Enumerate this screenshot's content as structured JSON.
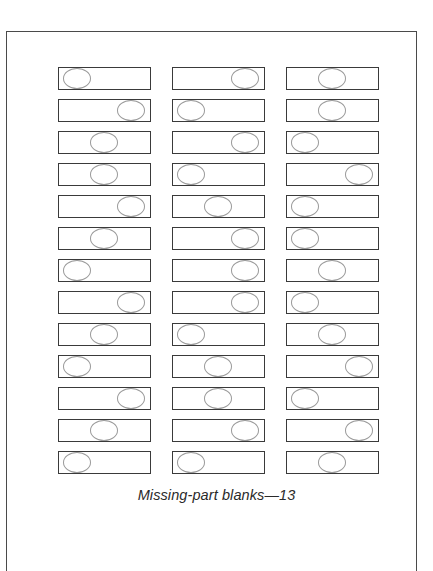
{
  "caption": "Missing-part blanks—13",
  "layout": {
    "column_x": [
      58,
      172,
      286
    ],
    "row_start_y": 67,
    "row_pitch": 32,
    "rows": 13
  },
  "colors": {
    "frame": "#4a4a4a",
    "blank_border": "#3a3a3a",
    "oval_border": "#9a9a9a",
    "caption": "#2a2a2a"
  },
  "columns": [
    {
      "name": "column-1",
      "oval_positions": [
        "L",
        "R",
        "C",
        "C",
        "R",
        "C",
        "L",
        "R",
        "C",
        "L",
        "R",
        "C",
        "L"
      ]
    },
    {
      "name": "column-2",
      "oval_positions": [
        "R",
        "L",
        "R",
        "L",
        "C",
        "R",
        "R",
        "R",
        "L",
        "C",
        "C",
        "R",
        "L"
      ]
    },
    {
      "name": "column-3",
      "oval_positions": [
        "C",
        "C",
        "L",
        "R",
        "L",
        "L",
        "C",
        "L",
        "C",
        "R",
        "L",
        "R",
        "C"
      ]
    }
  ]
}
